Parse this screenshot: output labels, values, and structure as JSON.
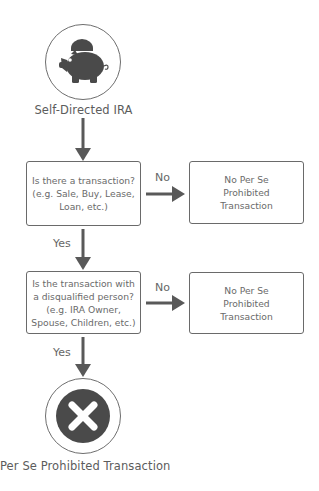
{
  "diagram": {
    "type": "flowchart",
    "colors": {
      "line": "#595959",
      "icon_fill": "#4a4a4a",
      "text": "#5c5c5c"
    },
    "start": {
      "label": "Self-Directed IRA",
      "icon": "piggy-bank-icon"
    },
    "decisions": [
      {
        "lines": [
          "Is there a transaction?",
          "(e.g. Sale, Buy, Lease,",
          "Loan, etc.)"
        ],
        "yes_label": "Yes",
        "no_label": "No",
        "no_outcome": {
          "lines": [
            "No Per Se",
            "Prohibited",
            "Transaction"
          ]
        }
      },
      {
        "lines": [
          "Is the transaction with",
          "a disqualified person?",
          "(e.g. IRA Owner,",
          "Spouse, Children, etc.)"
        ],
        "yes_label": "Yes",
        "no_label": "No",
        "no_outcome": {
          "lines": [
            "No Per Se",
            "Prohibited",
            "Transaction"
          ]
        }
      }
    ],
    "end": {
      "label": "Per Se Prohibited Transaction",
      "icon": "x-circle-icon"
    }
  }
}
